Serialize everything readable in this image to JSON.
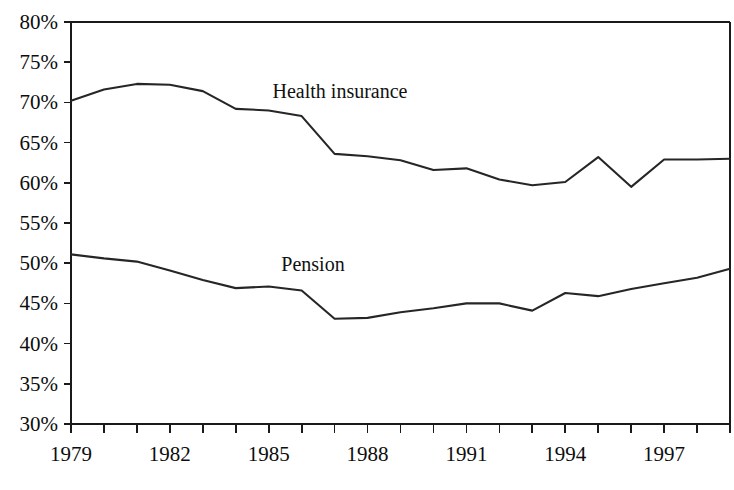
{
  "chart_data": {
    "type": "line",
    "title": "",
    "subtitle": "",
    "xlabel": "",
    "ylabel": "",
    "grid": false,
    "legend_position": "inline-annotation",
    "xlim": [
      1979,
      1999
    ],
    "ylim": [
      30,
      80
    ],
    "x": [
      1979,
      1980,
      1981,
      1982,
      1983,
      1984,
      1985,
      1986,
      1987,
      1988,
      1989,
      1990,
      1991,
      1992,
      1993,
      1994,
      1995,
      1996,
      1997,
      1998,
      1999
    ],
    "x_tick_values": [
      1979,
      1980,
      1981,
      1982,
      1983,
      1984,
      1985,
      1986,
      1987,
      1988,
      1989,
      1990,
      1991,
      1992,
      1993,
      1994,
      1995,
      1996,
      1997,
      1998,
      1999
    ],
    "x_tick_labels": [
      "1979",
      "",
      "",
      "1982",
      "",
      "",
      "1985",
      "",
      "",
      "1988",
      "",
      "",
      "1991",
      "",
      "",
      "1994",
      "",
      "",
      "1997",
      "",
      ""
    ],
    "y_tick_values": [
      30,
      35,
      40,
      45,
      50,
      55,
      60,
      65,
      70,
      75,
      80
    ],
    "y_tick_labels": [
      "30%",
      "35%",
      "40%",
      "45%",
      "50%",
      "55%",
      "60%",
      "65%",
      "70%",
      "75%",
      "80%"
    ],
    "series": [
      {
        "name": "Health insurance",
        "label_text": "Health insurance",
        "color": "#262626",
        "values": [
          70.2,
          71.6,
          72.3,
          72.2,
          71.4,
          69.2,
          69.0,
          68.3,
          63.6,
          63.3,
          62.8,
          61.6,
          61.8,
          60.4,
          59.7,
          60.1,
          63.2,
          59.5,
          62.9,
          62.9,
          63.0
        ]
      },
      {
        "name": "Pension",
        "label_text": "Pension",
        "color": "#262626",
        "values": [
          51.1,
          50.6,
          50.2,
          49.1,
          47.9,
          46.9,
          47.1,
          46.6,
          43.1,
          43.2,
          43.9,
          44.4,
          45.0,
          45.0,
          44.1,
          46.3,
          45.9,
          46.8,
          47.5,
          48.2,
          49.3
        ]
      }
    ]
  },
  "annotations": {
    "health_label": "Health insurance",
    "pension_label": "Pension"
  },
  "colors": {
    "line": "#262626",
    "axis": "#1a1a1a",
    "text": "#0d0d0d",
    "background": "#ffffff"
  }
}
